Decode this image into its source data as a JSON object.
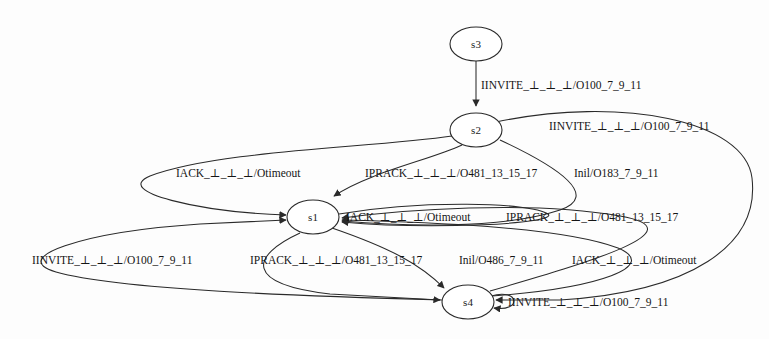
{
  "diagram": {
    "type": "finite-state-machine",
    "background_color": "#fdfdfd",
    "stroke_color": "#2a2a2a",
    "states": [
      {
        "id": "s3",
        "label": "s3",
        "cx": 476,
        "cy": 44,
        "rx": 26,
        "ry": 17
      },
      {
        "id": "s2",
        "label": "s2",
        "cx": 476,
        "cy": 130,
        "rx": 26,
        "ry": 17
      },
      {
        "id": "s1",
        "label": "s1",
        "cx": 313,
        "cy": 217,
        "rx": 26,
        "ry": 17
      },
      {
        "id": "s4",
        "label": "s4",
        "cx": 468,
        "cy": 302,
        "rx": 26,
        "ry": 17
      }
    ],
    "edge_labels": [
      {
        "id": "e-s3-s2",
        "text": "IINVITE_⊥_⊥_⊥/O100_7_9_11",
        "x": 481,
        "y": 89
      },
      {
        "id": "e-s2-self-top",
        "text": "IINVITE_⊥_⊥_⊥/O100_7_9_11",
        "x": 549,
        "y": 130
      },
      {
        "id": "e-iack-upper",
        "text": "IACK_⊥_⊥_⊥/Otimeout",
        "x": 176,
        "y": 177
      },
      {
        "id": "e-iprack-upper",
        "text": "IPRACK_⊥_⊥_⊥/O481_13_15_17",
        "x": 365,
        "y": 177
      },
      {
        "id": "e-inil-183",
        "text": "Inil/O183_7_9_11",
        "x": 574,
        "y": 177
      },
      {
        "id": "e-iack-mid",
        "text": "IACK_⊥_⊥_⊥/Otimeout",
        "x": 346,
        "y": 217
      },
      {
        "id": "e-iprack-mid",
        "text": "IPRACK_⊥_⊥_⊥/O481_13_15_17",
        "x": 506,
        "y": 217
      },
      {
        "id": "e-iinvite-low",
        "text": "IINVITE_⊥_⊥_⊥/O100_7_9_11",
        "x": 32,
        "y": 264
      },
      {
        "id": "e-iprack-low",
        "text": "IPRACK_⊥_⊥_⊥/O481_13_15_17",
        "x": 250,
        "y": 264
      },
      {
        "id": "e-inil-486",
        "text": "Inil/O486_7_9_11",
        "x": 459,
        "y": 264
      },
      {
        "id": "e-iack-low",
        "text": "IACK_⊥_⊥_⊥/Otimeout",
        "x": 572,
        "y": 264
      },
      {
        "id": "e-s4-self",
        "text": "IINVITE_⊥_⊥_⊥/O100_7_9_11",
        "x": 508,
        "y": 304
      }
    ]
  }
}
